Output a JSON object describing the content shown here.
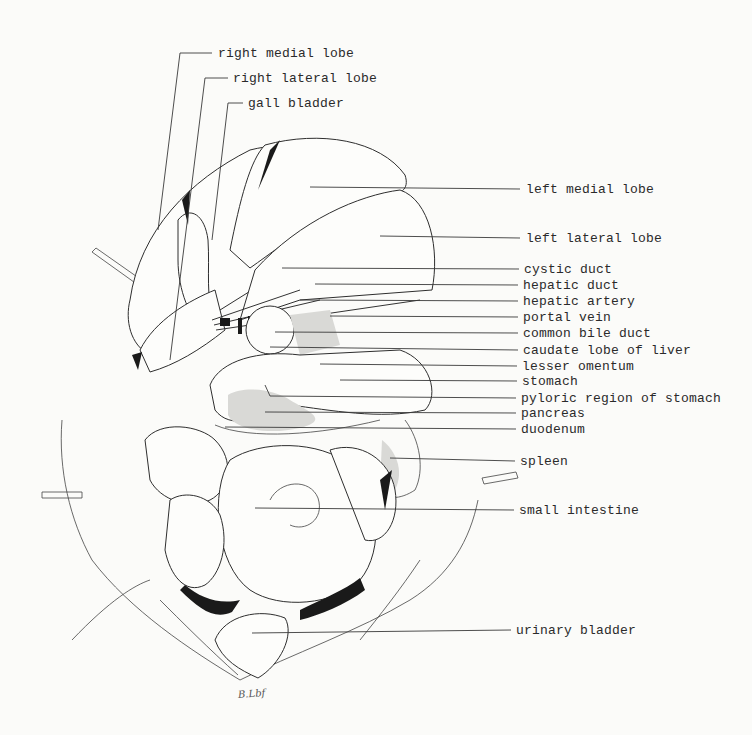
{
  "diagram": {
    "signature": "B.Lbf",
    "labels_left_top": [
      {
        "text": "right medial lobe",
        "x": 218,
        "y": 47
      },
      {
        "text": "right lateral lobe",
        "x": 233,
        "y": 72
      },
      {
        "text": "gall bladder",
        "x": 248,
        "y": 97
      }
    ],
    "labels_right": [
      {
        "text": "left medial lobe",
        "x": 526,
        "y": 183
      },
      {
        "text": "left lateral lobe",
        "x": 526,
        "y": 232
      },
      {
        "text": "cystic duct",
        "x": 524,
        "y": 263
      },
      {
        "text": "hepatic duct",
        "x": 523,
        "y": 279
      },
      {
        "text": "hepatic artery",
        "x": 523,
        "y": 295
      },
      {
        "text": "portal vein",
        "x": 523,
        "y": 311
      },
      {
        "text": "common bile duct",
        "x": 523,
        "y": 327
      },
      {
        "text": "caudate lobe of liver",
        "x": 523,
        "y": 344
      },
      {
        "text": "lesser omentum",
        "x": 522,
        "y": 360
      },
      {
        "text": "stomach",
        "x": 522,
        "y": 375
      },
      {
        "text": "pyloric region of stomach",
        "x": 521,
        "y": 392
      },
      {
        "text": "pancreas",
        "x": 521,
        "y": 407
      },
      {
        "text": "duodenum",
        "x": 521,
        "y": 423
      },
      {
        "text": "spleen",
        "x": 520,
        "y": 455
      },
      {
        "text": "small intestine",
        "x": 519,
        "y": 504
      },
      {
        "text": "urinary bladder",
        "x": 516,
        "y": 624
      }
    ]
  }
}
